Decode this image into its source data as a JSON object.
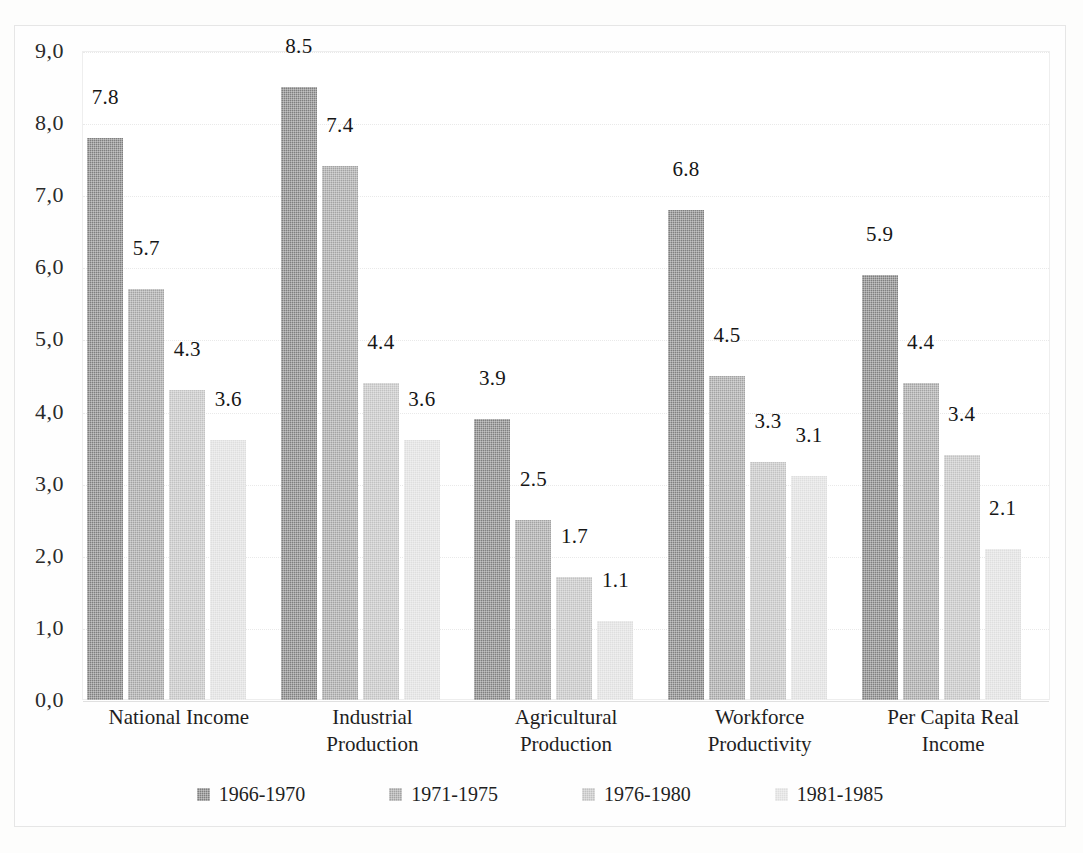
{
  "chart_data": {
    "type": "bar",
    "title": "",
    "subtitle": "",
    "xlabel": "",
    "ylabel": "",
    "ylim": [
      0,
      9
    ],
    "grid": true,
    "legend_position": "bottom",
    "categories": [
      "National Income",
      "Industrial\nProduction",
      "Agricultural\nProduction",
      "Workforce\nProductivity",
      "Per Capita Real\nIncome"
    ],
    "series": [
      {
        "name": "1966-1970",
        "color": "#7f7f7f",
        "values": [
          7.8,
          8.5,
          3.9,
          6.8,
          5.9
        ]
      },
      {
        "name": "1971-1975",
        "color": "#a3a3a3",
        "values": [
          5.7,
          7.4,
          2.5,
          4.5,
          4.4
        ]
      },
      {
        "name": "1976-1980",
        "color": "#c2c2c2",
        "values": [
          4.3,
          4.4,
          1.7,
          3.3,
          3.4
        ]
      },
      {
        "name": "1981-1985",
        "color": "#dedede",
        "values": [
          3.6,
          3.6,
          1.1,
          3.1,
          2.1
        ]
      }
    ],
    "value_labels": [
      [
        "7.8",
        "5.7",
        "4.3",
        "3.6"
      ],
      [
        "8.5",
        "7.4",
        "4.4",
        "3.6"
      ],
      [
        "3.9",
        "2.5",
        "1.7",
        "1.1"
      ],
      [
        "6.8",
        "4.5",
        "3.3",
        "3.1"
      ],
      [
        "5.9",
        "4.4",
        "3.4",
        "2.1"
      ]
    ],
    "y_ticks": [
      "0,0",
      "1,0",
      "2,0",
      "3,0",
      "4,0",
      "5,0",
      "6,0",
      "7,0",
      "8,0",
      "9,0"
    ],
    "y_tick_values": [
      0,
      1,
      2,
      3,
      4,
      5,
      6,
      7,
      8,
      9
    ]
  },
  "legend": {
    "items": [
      {
        "label": "1966-1970",
        "color": "#7f7f7f"
      },
      {
        "label": "1971-1975",
        "color": "#a3a3a3"
      },
      {
        "label": "1976-1980",
        "color": "#c2c2c2"
      },
      {
        "label": "1981-1985",
        "color": "#dedede"
      }
    ]
  },
  "colors": {
    "plot_background": "#ffffff",
    "page_background": "#fdfdfc",
    "gridline": "#e9e9e9",
    "frame": "#e6e6e6",
    "text": "#1b1b1b"
  }
}
